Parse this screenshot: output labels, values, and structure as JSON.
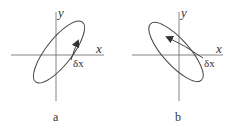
{
  "diagrams": [
    {
      "id": "a",
      "caption": "a",
      "x_label": "x",
      "y_label": "y",
      "displacement_label": "δx",
      "ellipse_orientation": "tilted up-right (positive slope)",
      "arrow_direction": "up-right along inner path"
    },
    {
      "id": "b",
      "caption": "b",
      "x_label": "x",
      "y_label": "y",
      "displacement_label": "δx",
      "ellipse_orientation": "tilted up-left (negative slope)",
      "arrow_direction": "up-left along inner path"
    }
  ],
  "colors": {
    "stroke": "#444444",
    "axis": "#666666",
    "text": "#333333",
    "background": "#ffffff"
  }
}
